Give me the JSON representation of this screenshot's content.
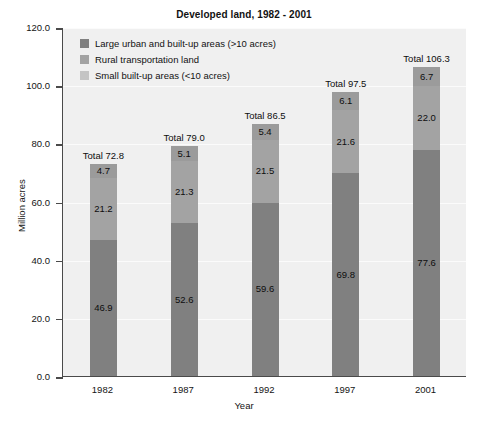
{
  "chart_data": {
    "type": "bar",
    "subtype": "stacked",
    "title": "Developed land, 1982 - 2001",
    "xlabel": "Year",
    "ylabel": "Million acres",
    "categories": [
      "1982",
      "1987",
      "1992",
      "1997",
      "2001"
    ],
    "ylim": [
      0.0,
      120.0
    ],
    "yticks": [
      "0.0",
      "20.0",
      "40.0",
      "60.0",
      "80.0",
      "100.0",
      "120.0"
    ],
    "ytick_values": [
      0.0,
      20.0,
      40.0,
      60.0,
      80.0,
      100.0,
      120.0
    ],
    "grid": true,
    "legend_position": "upper-left-inside",
    "series": [
      {
        "name": "Large urban and built-up areas (>10 acres)",
        "color": "#808080",
        "values": [
          46.9,
          52.6,
          59.6,
          69.8,
          77.6
        ],
        "labels": [
          "46.9",
          "52.6",
          "59.6",
          "69.8",
          "77.6"
        ]
      },
      {
        "name": "Rural transportation land",
        "color": "#a3a3a3",
        "values": [
          21.2,
          21.3,
          21.5,
          21.6,
          22.0
        ],
        "labels": [
          "21.2",
          "21.3",
          "21.5",
          "21.6",
          "22.0"
        ]
      },
      {
        "name": "Small built-up areas (<10 acres)",
        "color": "#9b9b9b",
        "values": [
          4.7,
          5.1,
          5.4,
          6.1,
          6.7
        ],
        "labels": [
          "4.7",
          "5.1",
          "5.4",
          "6.1",
          "6.7"
        ]
      }
    ],
    "totals": [
      72.8,
      79.0,
      86.5,
      97.5,
      106.3
    ],
    "total_labels": [
      "Total 72.8",
      "Total 79.0",
      "Total 86.5",
      "Total 97.5",
      "Total 106.3"
    ],
    "colors": {
      "plot_background": "#f0f0f0",
      "page_background": "#ffffff",
      "axis": "#4a4a4a",
      "gridline": "#fbfbfb",
      "text": "#121212"
    }
  }
}
